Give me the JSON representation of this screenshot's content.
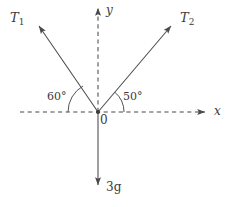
{
  "diagram": {
    "type": "free-body-diagram",
    "stroke_color": "#4a4a4a",
    "text_color": "#3b3b3b",
    "background_color": "#ffffff",
    "origin": {
      "label": "0",
      "x": 98,
      "y": 112
    },
    "axes": {
      "x": {
        "label": "x",
        "style": "dashed",
        "arrow": true,
        "from_x": 20,
        "to_x": 208,
        "y": 112
      },
      "y": {
        "label": "y",
        "style": "dashed",
        "arrow": true,
        "from_y": 112,
        "to_y": 5,
        "x": 98
      }
    },
    "vectors": [
      {
        "name": "tension-1",
        "label": "T",
        "subscript": "1",
        "angle_deg": 120,
        "angle_from_negative_x_deg": 60,
        "direction": "up-left",
        "style": "solid",
        "arrow": true,
        "tip": {
          "x": 35,
          "y": 22
        }
      },
      {
        "name": "tension-2",
        "label": "T",
        "subscript": "2",
        "angle_deg": 50,
        "angle_from_positive_x_deg": 50,
        "direction": "up-right",
        "style": "solid",
        "arrow": true,
        "tip": {
          "x": 175,
          "y": 22
        }
      },
      {
        "name": "weight",
        "label": "3",
        "unit": "g",
        "full_label": "3 g",
        "angle_deg": 270,
        "direction": "down",
        "style": "solid",
        "arrow": true,
        "tip": {
          "x": 98,
          "y": 188
        }
      }
    ],
    "angles": [
      {
        "name": "angle-60",
        "value": "60",
        "unit": "°",
        "text": "60°",
        "between": "negative-x-axis and tension-1",
        "arc_radius": 30,
        "side": "left"
      },
      {
        "name": "angle-50",
        "value": "50",
        "unit": "°",
        "text": "50°",
        "between": "positive-x-axis and tension-2",
        "arc_radius": 26,
        "side": "right"
      }
    ]
  }
}
